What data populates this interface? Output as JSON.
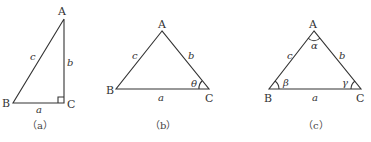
{
  "figures": [
    {
      "id": "a",
      "caption": "（a）",
      "vertices": {
        "A": "A",
        "B": "B",
        "C": "C"
      },
      "sides": {
        "a": "a",
        "b": "b",
        "c": "c"
      },
      "right_angle_at": "C"
    },
    {
      "id": "b",
      "caption": "（b）",
      "vertices": {
        "A": "A",
        "B": "B",
        "C": "C"
      },
      "sides": {
        "a": "a",
        "b": "b",
        "c": "c"
      },
      "angle_labels": {
        "C": "θ"
      }
    },
    {
      "id": "c",
      "caption": "（c）",
      "vertices": {
        "A": "A",
        "B": "B",
        "C": "C"
      },
      "sides": {
        "a": "a",
        "b": "b",
        "c": "c"
      },
      "angle_labels": {
        "A": "α",
        "B": "β",
        "C": "γ"
      }
    }
  ]
}
